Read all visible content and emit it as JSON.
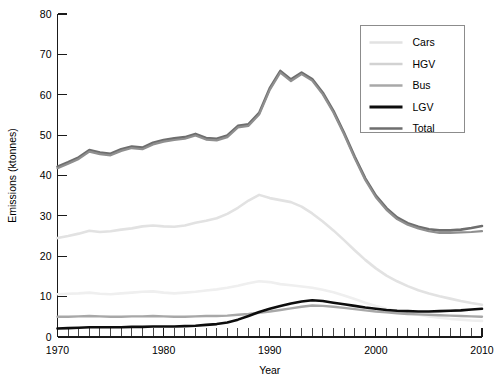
{
  "chart_data": {
    "type": "line",
    "title": "",
    "xlabel": "Year",
    "ylabel": "Emissions (ktonnes)",
    "xlim": [
      1970,
      2010
    ],
    "ylim": [
      0,
      80
    ],
    "xticks": [
      1970,
      1980,
      1990,
      2000,
      2010
    ],
    "yticks": [
      0,
      10,
      20,
      30,
      40,
      50,
      60,
      70,
      80
    ],
    "xtick_labels": [
      "1970",
      "1980",
      "1990",
      "2000",
      "2010"
    ],
    "ytick_labels": [
      "0",
      "10",
      "20",
      "30",
      "40",
      "50",
      "60",
      "70",
      "80"
    ],
    "minor_xtick_step": 1,
    "grid": false,
    "legend_position": "top-right",
    "x": [
      1970,
      1971,
      1972,
      1973,
      1974,
      1975,
      1976,
      1977,
      1978,
      1979,
      1980,
      1981,
      1982,
      1983,
      1984,
      1985,
      1986,
      1987,
      1988,
      1989,
      1990,
      1991,
      1992,
      1993,
      1994,
      1995,
      1996,
      1997,
      1998,
      1999,
      2000,
      2001,
      2002,
      2003,
      2004,
      2005,
      2006,
      2007,
      2008,
      2009,
      2010
    ],
    "series": [
      {
        "name": "Cars",
        "color": "#e2e2e2",
        "width": 2.6,
        "values": [
          24.5,
          25.0,
          25.6,
          26.3,
          26.0,
          26.2,
          26.6,
          26.9,
          27.4,
          27.6,
          27.4,
          27.3,
          27.6,
          28.3,
          28.8,
          29.4,
          30.5,
          32.0,
          33.8,
          35.2,
          34.4,
          33.9,
          33.4,
          32.3,
          30.6,
          28.6,
          26.4,
          24.0,
          21.5,
          19.1,
          17.0,
          15.2,
          13.8,
          12.6,
          11.6,
          10.8,
          10.1,
          9.5,
          8.9,
          8.4,
          8.0
        ]
      },
      {
        "name": "HGV",
        "color": "#efefef",
        "width": 2.6,
        "values": [
          10.6,
          10.7,
          10.8,
          11.0,
          10.7,
          10.6,
          10.8,
          11.0,
          11.2,
          11.3,
          11.0,
          10.8,
          11.0,
          11.2,
          11.5,
          11.8,
          12.2,
          12.7,
          13.3,
          13.8,
          13.6,
          13.1,
          12.8,
          12.5,
          12.2,
          11.7,
          11.1,
          10.3,
          9.4,
          8.5,
          7.7,
          7.0,
          6.4,
          5.9,
          5.5,
          5.1,
          4.8,
          4.5,
          4.3,
          4.1,
          4.0
        ]
      },
      {
        "name": "Bus",
        "color": "#a8a8a8",
        "width": 2.4,
        "values": [
          5.0,
          5.0,
          5.1,
          5.2,
          5.1,
          5.0,
          5.0,
          5.1,
          5.1,
          5.2,
          5.1,
          5.0,
          5.0,
          5.1,
          5.2,
          5.2,
          5.3,
          5.5,
          5.7,
          6.0,
          6.3,
          6.7,
          7.1,
          7.5,
          7.8,
          7.7,
          7.5,
          7.2,
          6.9,
          6.6,
          6.3,
          6.1,
          5.9,
          5.7,
          5.6,
          5.5,
          5.4,
          5.3,
          5.2,
          5.1,
          5.0
        ]
      },
      {
        "name": "LGV",
        "color": "#0d0d0d",
        "width": 2.6,
        "values": [
          2.1,
          2.2,
          2.3,
          2.4,
          2.4,
          2.4,
          2.4,
          2.5,
          2.5,
          2.6,
          2.6,
          2.6,
          2.7,
          2.8,
          3.0,
          3.2,
          3.6,
          4.3,
          5.2,
          6.2,
          7.0,
          7.7,
          8.3,
          8.8,
          9.1,
          8.9,
          8.5,
          8.1,
          7.7,
          7.3,
          7.0,
          6.7,
          6.5,
          6.4,
          6.3,
          6.3,
          6.4,
          6.5,
          6.6,
          6.8,
          7.0
        ]
      },
      {
        "name": "Total",
        "color": "#6e6e6e",
        "width": 2.6,
        "values": [
          42.2,
          43.3,
          44.5,
          46.3,
          45.7,
          45.4,
          46.5,
          47.2,
          46.9,
          48.1,
          48.8,
          49.2,
          49.5,
          50.3,
          49.3,
          49.1,
          49.9,
          52.3,
          52.7,
          55.5,
          61.6,
          65.9,
          63.8,
          65.5,
          63.9,
          60.5,
          56.0,
          50.6,
          44.7,
          39.3,
          35.0,
          31.9,
          29.6,
          28.2,
          27.3,
          26.7,
          26.4,
          26.4,
          26.6,
          27.0,
          27.5
        ]
      },
      {
        "name": "Total2",
        "color": "#8f8f8f",
        "width": 2.2,
        "values": [
          41.8,
          42.9,
          44.1,
          45.9,
          45.3,
          45.0,
          46.1,
          46.8,
          46.5,
          47.7,
          48.4,
          48.8,
          49.1,
          49.9,
          48.9,
          48.7,
          49.5,
          51.9,
          52.3,
          55.1,
          61.2,
          65.5,
          63.4,
          65.1,
          63.5,
          60.1,
          55.6,
          50.2,
          44.3,
          38.9,
          34.6,
          31.5,
          29.2,
          27.8,
          26.9,
          26.2,
          25.8,
          25.8,
          25.9,
          26.0,
          26.2
        ]
      }
    ],
    "legend_entries": [
      {
        "label": "Cars",
        "color": "#e2e2e2",
        "width": 2.6
      },
      {
        "label": "HGV",
        "color": "#d2d2d2",
        "width": 2.6
      },
      {
        "label": "Bus",
        "color": "#a8a8a8",
        "width": 2.6
      },
      {
        "label": "LGV",
        "color": "#0d0d0d",
        "width": 3.0
      },
      {
        "label": "Total",
        "color": "#6e6e6e",
        "width": 2.6
      }
    ]
  }
}
